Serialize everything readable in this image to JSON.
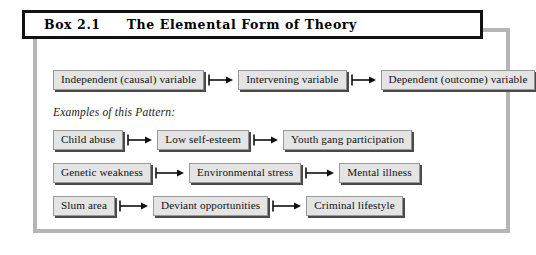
{
  "figure": {
    "title": {
      "label": "Box 2.1",
      "heading": "The Elemental Form of Theory"
    },
    "caption": "Examples of this Pattern:",
    "colors": {
      "frame_border": "#b5b5b5",
      "title_border": "#111111",
      "node_fill": "#e4e4e4",
      "node_border": "#9a9a9a",
      "node_shadow": "#4a4a4a",
      "arrow": "#101010",
      "background": "#ffffff"
    },
    "rows": [
      {
        "id": "primary",
        "nodes": [
          "Independent (causal) variable",
          "Intervening variable",
          "Dependent (outcome) variable"
        ]
      },
      {
        "id": "example-1",
        "nodes": [
          "Child abuse",
          "Low self-esteem",
          "Youth gang participation"
        ]
      },
      {
        "id": "example-2",
        "nodes": [
          "Genetic weakness",
          "Environmental stress",
          "Mental illness"
        ]
      },
      {
        "id": "example-3",
        "nodes": [
          "Slum area",
          "Deviant opportunities",
          "Criminal lifestyle"
        ]
      }
    ],
    "icons": {
      "connector": "arrow-right-icon"
    }
  }
}
